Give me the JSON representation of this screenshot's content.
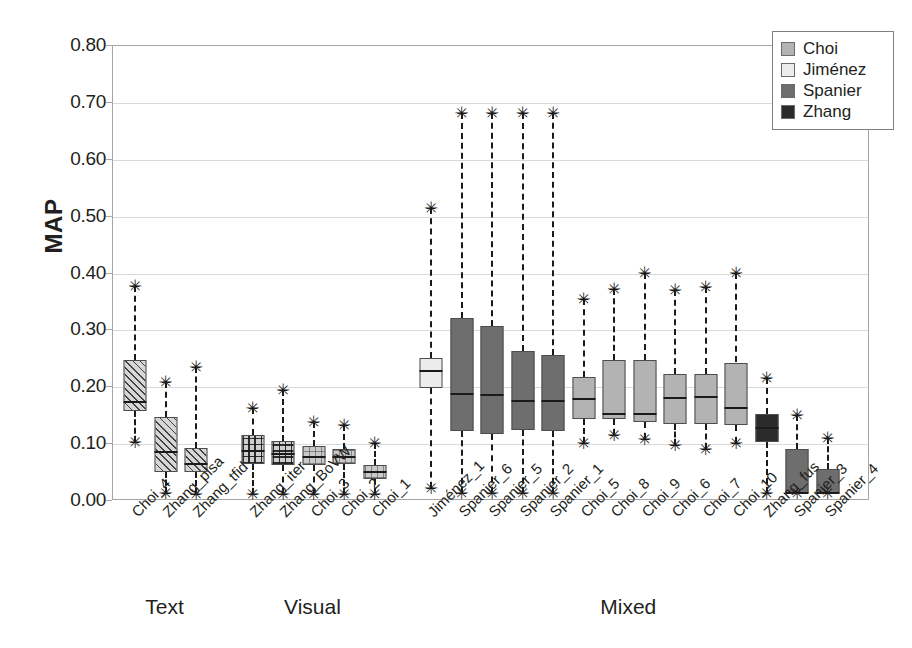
{
  "chart_data": {
    "type": "box",
    "title": "",
    "xlabel": "",
    "ylabel": "MAP",
    "ylim": [
      0.0,
      0.8
    ],
    "yticks": [
      "0.00",
      "0.10",
      "0.20",
      "0.30",
      "0.40",
      "0.50",
      "0.60",
      "0.70",
      "0.80"
    ],
    "ytick_values": [
      0.0,
      0.1,
      0.2,
      0.3,
      0.4,
      0.5,
      0.6,
      0.7,
      0.8
    ],
    "grid": "horizontal",
    "legend_position": "top-right",
    "legend": [
      {
        "label": "Choi",
        "color": "#b3b3b3"
      },
      {
        "label": "Jiménez",
        "color": "#ececec"
      },
      {
        "label": "Spanier",
        "color": "#6e6e6e"
      },
      {
        "label": "Zhang",
        "color": "#2b2b2b"
      }
    ],
    "groups": [
      {
        "name": "Text",
        "start": 0,
        "end": 2
      },
      {
        "name": "Visual",
        "start": 3,
        "end": 7
      },
      {
        "name": "Mixed",
        "start": 8,
        "end": 21
      }
    ],
    "boxes": [
      {
        "label": "Choi_4",
        "group": "Text",
        "series": "Choi",
        "fill": "diag",
        "whisker_low": 0.1,
        "q1": 0.155,
        "median": 0.17,
        "q3": 0.245,
        "whisker_high": 0.375,
        "outliers": [
          0.375,
          0.1
        ]
      },
      {
        "label": "Zhang_plsa",
        "group": "Text",
        "series": "Zhang",
        "fill": "diag",
        "whisker_low": 0.01,
        "q1": 0.048,
        "median": 0.082,
        "q3": 0.145,
        "whisker_high": 0.205,
        "outliers": [
          0.205,
          0.01
        ]
      },
      {
        "label": "Zhang_tfid",
        "group": "Text",
        "series": "Zhang",
        "fill": "diag",
        "whisker_low": 0.008,
        "q1": 0.048,
        "median": 0.062,
        "q3": 0.09,
        "whisker_high": 0.232,
        "outliers": [
          0.232,
          0.008
        ]
      },
      {
        "label": "Zhang_iter",
        "group": "Visual",
        "series": "Zhang",
        "fill": "grid-dark",
        "whisker_low": 0.008,
        "q1": 0.062,
        "median": 0.085,
        "q3": 0.112,
        "whisker_high": 0.16,
        "outliers": [
          0.16,
          0.008
        ]
      },
      {
        "label": "Zhang_BoVW",
        "group": "Visual",
        "series": "Zhang",
        "fill": "grid-dark",
        "whisker_low": 0.008,
        "q1": 0.06,
        "median": 0.08,
        "q3": 0.102,
        "whisker_high": 0.192,
        "outliers": [
          0.192,
          0.008
        ]
      },
      {
        "label": "Choi_3",
        "group": "Visual",
        "series": "Choi",
        "fill": "grid-light",
        "whisker_low": 0.008,
        "q1": 0.06,
        "median": 0.074,
        "q3": 0.094,
        "whisker_high": 0.135,
        "outliers": [
          0.135,
          0.008
        ]
      },
      {
        "label": "Choi_2",
        "group": "Visual",
        "series": "Choi",
        "fill": "grid-light",
        "whisker_low": 0.008,
        "q1": 0.062,
        "median": 0.073,
        "q3": 0.088,
        "whisker_high": 0.13,
        "outliers": [
          0.13,
          0.008
        ]
      },
      {
        "label": "Choi_1",
        "group": "Visual",
        "series": "Choi",
        "fill": "grid-light",
        "whisker_low": 0.008,
        "q1": 0.036,
        "median": 0.048,
        "q3": 0.06,
        "whisker_high": 0.098,
        "outliers": [
          0.098,
          0.008
        ]
      },
      {
        "label": "Jiménez_1",
        "group": "Mixed",
        "series": "Jiménez",
        "fill": "solid",
        "whisker_low": 0.02,
        "q1": 0.195,
        "median": 0.225,
        "q3": 0.248,
        "whisker_high": 0.512,
        "outliers": [
          0.512,
          0.02
        ]
      },
      {
        "label": "Spanier_6",
        "group": "Mixed",
        "series": "Spanier",
        "fill": "solid",
        "whisker_low": 0.01,
        "q1": 0.12,
        "median": 0.185,
        "q3": 0.318,
        "whisker_high": 0.678,
        "outliers": [
          0.678,
          0.01
        ]
      },
      {
        "label": "Spanier_5",
        "group": "Mixed",
        "series": "Spanier",
        "fill": "solid",
        "whisker_low": 0.01,
        "q1": 0.115,
        "median": 0.182,
        "q3": 0.305,
        "whisker_high": 0.678,
        "outliers": [
          0.678,
          0.01
        ]
      },
      {
        "label": "Spanier_2",
        "group": "Mixed",
        "series": "Spanier",
        "fill": "solid",
        "whisker_low": 0.01,
        "q1": 0.122,
        "median": 0.172,
        "q3": 0.26,
        "whisker_high": 0.678,
        "outliers": [
          0.678,
          0.01
        ]
      },
      {
        "label": "Spanier_1",
        "group": "Mixed",
        "series": "Spanier",
        "fill": "solid",
        "whisker_low": 0.01,
        "q1": 0.12,
        "median": 0.172,
        "q3": 0.253,
        "whisker_high": 0.678,
        "outliers": [
          0.678,
          0.01
        ]
      },
      {
        "label": "Choi_5",
        "group": "Mixed",
        "series": "Choi",
        "fill": "solid",
        "whisker_low": 0.098,
        "q1": 0.14,
        "median": 0.175,
        "q3": 0.215,
        "whisker_high": 0.352,
        "outliers": [
          0.352,
          0.098
        ]
      },
      {
        "label": "Choi_8",
        "group": "Mixed",
        "series": "Choi",
        "fill": "solid",
        "whisker_low": 0.112,
        "q1": 0.14,
        "median": 0.15,
        "q3": 0.245,
        "whisker_high": 0.37,
        "outliers": [
          0.37,
          0.112
        ]
      },
      {
        "label": "Choi_9",
        "group": "Mixed",
        "series": "Choi",
        "fill": "solid",
        "whisker_low": 0.105,
        "q1": 0.135,
        "median": 0.15,
        "q3": 0.245,
        "whisker_high": 0.398,
        "outliers": [
          0.398,
          0.105
        ]
      },
      {
        "label": "Choi_6",
        "group": "Mixed",
        "series": "Choi",
        "fill": "solid",
        "whisker_low": 0.095,
        "q1": 0.132,
        "median": 0.178,
        "q3": 0.22,
        "whisker_high": 0.368,
        "outliers": [
          0.368,
          0.095
        ]
      },
      {
        "label": "Choi_7",
        "group": "Mixed",
        "series": "Choi",
        "fill": "solid",
        "whisker_low": 0.088,
        "q1": 0.132,
        "median": 0.18,
        "q3": 0.22,
        "whisker_high": 0.372,
        "outliers": [
          0.372,
          0.088
        ]
      },
      {
        "label": "Choi_10",
        "group": "Mixed",
        "series": "Choi",
        "fill": "solid",
        "whisker_low": 0.098,
        "q1": 0.13,
        "median": 0.16,
        "q3": 0.24,
        "whisker_high": 0.398,
        "outliers": [
          0.398,
          0.098
        ]
      },
      {
        "label": "Zhang_fus",
        "group": "Mixed",
        "series": "Zhang",
        "fill": "solid",
        "whisker_low": 0.01,
        "q1": 0.1,
        "median": 0.125,
        "q3": 0.15,
        "whisker_high": 0.212,
        "outliers": [
          0.212,
          0.01
        ]
      },
      {
        "label": "Spanier_3",
        "group": "Mixed",
        "series": "Spanier",
        "fill": "solid",
        "whisker_low": 0.01,
        "q1": 0.01,
        "median": 0.01,
        "q3": 0.088,
        "whisker_high": 0.148,
        "outliers": [
          0.148,
          0.01
        ]
      },
      {
        "label": "Spanier_4",
        "group": "Mixed",
        "series": "Spanier",
        "fill": "solid",
        "whisker_low": 0.01,
        "q1": 0.01,
        "median": 0.01,
        "q3": 0.052,
        "whisker_high": 0.108,
        "outliers": [
          0.108,
          0.01
        ]
      }
    ]
  }
}
